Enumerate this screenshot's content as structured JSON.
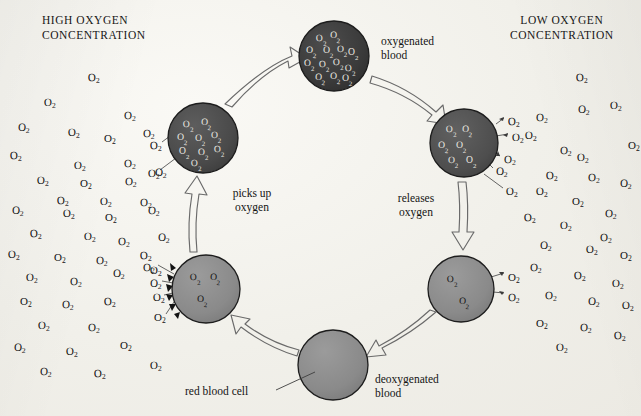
{
  "canvas": {
    "width": 641,
    "height": 416,
    "background": "#f1f0ea"
  },
  "headings": {
    "left": "HIGH OXYGEN\nCONCENTRATION",
    "right": "LOW OXYGEN\nCONCENTRATION"
  },
  "labels": {
    "oxygenated_blood": "oxygenated\nblood",
    "deoxygenated_blood": "deoxygenated\nblood",
    "picks_up_oxygen": "picks up\noxygen",
    "releases_oxygen": "releases\noxygen",
    "red_blood_cell": "red blood cell"
  },
  "molecule_label": "O",
  "molecule_subscript": "2",
  "colors": {
    "cell_full": "#3a3a3a",
    "cell_high": "#4a4a4a",
    "cell_mid": "#6e6e6e",
    "cell_low": "#8a8a8a",
    "cell_empty": "#8c8c8c",
    "cell_stroke": "#1d1d1d",
    "arrow_stroke": "#5c5c5c",
    "leader_stroke": "#4a4a4a",
    "text": "#141414",
    "paper": "#f1f0ea"
  },
  "cells": [
    {
      "id": "oxygenated-top",
      "cx": 334,
      "cy": 56,
      "r": 35,
      "fill": "#3a3a3a",
      "saturation": "fully-oxygenated",
      "inner_o2": 13,
      "inner_positions": [
        [
          -12,
          -18
        ],
        [
          2,
          -21
        ],
        [
          -22,
          -6
        ],
        [
          -5,
          -6
        ],
        [
          9,
          -7
        ],
        [
          20,
          -4
        ],
        [
          -24,
          7
        ],
        [
          -9,
          8
        ],
        [
          5,
          6
        ],
        [
          17,
          12
        ],
        [
          -13,
          21
        ],
        [
          2,
          20
        ],
        [
          14,
          22
        ]
      ]
    },
    {
      "id": "releasing-right-upper",
      "cx": 464,
      "cy": 143,
      "r": 34,
      "fill": "#4e4e4e",
      "saturation": "releasing",
      "inner_o2": 6,
      "inner_positions": [
        [
          -12,
          -14
        ],
        [
          4,
          -14
        ],
        [
          -20,
          2
        ],
        [
          -2,
          2
        ],
        [
          -10,
          17
        ],
        [
          8,
          17
        ]
      ]
    },
    {
      "id": "deoxygenated-right-lower",
      "cx": 461,
      "cy": 289,
      "r": 33,
      "fill": "#8b8b8b",
      "saturation": "nearly-empty",
      "inner_o2": 2,
      "inner_positions": [
        [
          -8,
          -10
        ],
        [
          4,
          12
        ]
      ]
    },
    {
      "id": "deoxygenated-bottom",
      "cx": 333,
      "cy": 365,
      "r": 35,
      "fill": "#8c8c8c",
      "saturation": "empty",
      "inner_o2": 0,
      "inner_positions": []
    },
    {
      "id": "picking-up-left-lower",
      "cx": 206,
      "cy": 289,
      "r": 34,
      "fill": "#8a8a8a",
      "saturation": "loading",
      "inner_o2": 3,
      "inner_positions": [
        [
          -10,
          -12
        ],
        [
          10,
          -12
        ],
        [
          -3,
          10
        ]
      ]
    },
    {
      "id": "loaded-left-upper",
      "cx": 203,
      "cy": 138,
      "r": 35,
      "fill": "#4a4a4a",
      "saturation": "loaded",
      "inner_o2": 9,
      "inner_positions": [
        [
          -14,
          -14
        ],
        [
          4,
          -16
        ],
        [
          -20,
          -1
        ],
        [
          -2,
          0
        ],
        [
          14,
          -3
        ],
        [
          -18,
          13
        ],
        [
          1,
          14
        ],
        [
          17,
          11
        ],
        [
          -6,
          25
        ]
      ]
    }
  ],
  "flow_arrows": [
    {
      "from": "loaded-left-upper",
      "to": "oxygenated-top"
    },
    {
      "from": "oxygenated-top",
      "to": "releasing-right-upper"
    },
    {
      "from": "releasing-right-upper",
      "to": "deoxygenated-right-lower"
    },
    {
      "from": "deoxygenated-right-lower",
      "to": "deoxygenated-bottom"
    },
    {
      "from": "deoxygenated-bottom",
      "to": "picking-up-left-lower"
    },
    {
      "from": "picking-up-left-lower",
      "to": "loaded-left-upper"
    }
  ],
  "left_field_o2": [
    [
      88,
      72
    ],
    [
      44,
      97
    ],
    [
      124,
      110
    ],
    [
      18,
      122
    ],
    [
      68,
      127
    ],
    [
      104,
      133
    ],
    [
      143,
      128
    ],
    [
      10,
      150
    ],
    [
      74,
      160
    ],
    [
      124,
      158
    ],
    [
      155,
      167
    ],
    [
      37,
      175
    ],
    [
      80,
      178
    ],
    [
      125,
      176
    ],
    [
      57,
      195
    ],
    [
      100,
      196
    ],
    [
      140,
      197
    ],
    [
      12,
      205
    ],
    [
      63,
      208
    ],
    [
      105,
      212
    ],
    [
      148,
      205
    ],
    [
      30,
      228
    ],
    [
      84,
      231
    ],
    [
      118,
      236
    ],
    [
      158,
      232
    ],
    [
      8,
      249
    ],
    [
      54,
      252
    ],
    [
      96,
      255
    ],
    [
      140,
      250
    ],
    [
      26,
      272
    ],
    [
      70,
      276
    ],
    [
      113,
      268
    ],
    [
      150,
      265
    ],
    [
      20,
      296
    ],
    [
      62,
      299
    ],
    [
      104,
      296
    ],
    [
      38,
      320
    ],
    [
      88,
      322
    ],
    [
      14,
      342
    ],
    [
      66,
      346
    ],
    [
      120,
      340
    ],
    [
      40,
      366
    ],
    [
      94,
      368
    ],
    [
      150,
      360
    ]
  ],
  "right_field_o2": [
    [
      576,
      72
    ],
    [
      610,
      100
    ],
    [
      536,
      112
    ],
    [
      578,
      104
    ],
    [
      525,
      130
    ],
    [
      628,
      140
    ],
    [
      560,
      145
    ],
    [
      546,
      170
    ],
    [
      577,
      152
    ],
    [
      588,
      172
    ],
    [
      620,
      178
    ],
    [
      536,
      186
    ],
    [
      572,
      196
    ],
    [
      605,
      208
    ],
    [
      524,
      212
    ],
    [
      560,
      220
    ],
    [
      600,
      232
    ],
    [
      540,
      240
    ],
    [
      586,
      244
    ],
    [
      620,
      250
    ],
    [
      530,
      262
    ],
    [
      574,
      270
    ],
    [
      612,
      278
    ],
    [
      545,
      290
    ],
    [
      588,
      296
    ],
    [
      622,
      300
    ],
    [
      536,
      318
    ],
    [
      580,
      322
    ],
    [
      614,
      330
    ],
    [
      556,
      342
    ]
  ],
  "cell_edge_o2_left": [
    [
      150,
      140
    ],
    [
      148,
      168
    ],
    [
      143,
      262
    ],
    [
      150,
      278
    ],
    [
      153,
      292
    ],
    [
      154,
      312
    ]
  ],
  "cell_edge_o2_right": [
    [
      508,
      116
    ],
    [
      512,
      132
    ],
    [
      504,
      154
    ],
    [
      496,
      166
    ],
    [
      506,
      186
    ],
    [
      508,
      272
    ],
    [
      508,
      292
    ]
  ]
}
